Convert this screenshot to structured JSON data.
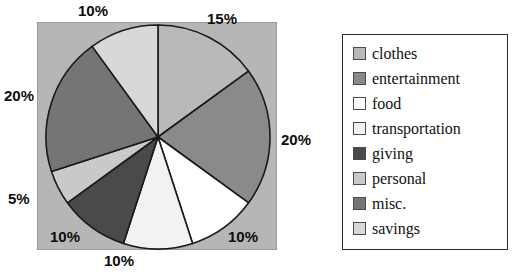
{
  "chart_data": {
    "type": "pie",
    "title": "",
    "categories": [
      "clothes",
      "entertainment",
      "food",
      "transportation",
      "giving",
      "personal",
      "misc.",
      "savings"
    ],
    "values": [
      15,
      20,
      10,
      10,
      10,
      5,
      20,
      10
    ],
    "value_labels": [
      "15%",
      "20%",
      "10%",
      "10%",
      "10%",
      "5%",
      "20%",
      "10%"
    ],
    "unit": "%",
    "start_angle_deg": 0,
    "direction": "clockwise",
    "legend_position": "right",
    "grid": false,
    "colors": [
      "#b9b9b9",
      "#8a8a8a",
      "#ffffff",
      "#f2f2f2",
      "#4a4a4a",
      "#c9c9c9",
      "#757575",
      "#d8d8d8"
    ],
    "slice_border_color": "#1a1a1a",
    "plot_background": "#b6b6b6"
  },
  "pie_labels": {
    "savings": "10%",
    "clothes": "15%",
    "entertainment": "20%",
    "transportation": "10%",
    "food": "10%",
    "giving": "10%",
    "personal": "5%",
    "misc": "20%"
  },
  "legend": {
    "items": [
      {
        "label": "clothes",
        "color": "#b9b9b9"
      },
      {
        "label": "entertainment",
        "color": "#8a8a8a"
      },
      {
        "label": "food",
        "color": "#ffffff"
      },
      {
        "label": "transportation",
        "color": "#f2f2f2"
      },
      {
        "label": "giving",
        "color": "#4a4a4a"
      },
      {
        "label": "personal",
        "color": "#c9c9c9"
      },
      {
        "label": "misc.",
        "color": "#757575"
      },
      {
        "label": "savings",
        "color": "#d8d8d8"
      }
    ]
  }
}
